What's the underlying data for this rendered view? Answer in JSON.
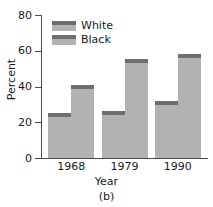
{
  "chart_data": {
    "type": "bar",
    "title": "",
    "subtitle": "",
    "caption": "(b)",
    "xlabel": "Year",
    "ylabel": "Percent",
    "categories": [
      "1968",
      "1979",
      "1990"
    ],
    "series": [
      {
        "name": "White",
        "values": [
          25,
          26.5,
          32
        ]
      },
      {
        "name": "Black",
        "values": [
          41,
          55.5,
          58
        ]
      }
    ],
    "ylim": [
      0,
      80
    ],
    "yticks": [
      0,
      20,
      40,
      60,
      80
    ],
    "ytick_labels": [
      "0",
      "20",
      "40",
      "60",
      "80"
    ],
    "grid": false,
    "legend_position": "upper-left-inside",
    "bar_fill_color": "#b2b2b2",
    "bar_cap_color": "#6e6e6e",
    "axis_color": "#4a4a4a",
    "text_color": "#1a1a1a",
    "background_color": "#ffffff"
  },
  "legend": {
    "items": [
      {
        "label": "White"
      },
      {
        "label": "Black"
      }
    ]
  },
  "axes": {
    "y_title": "Percent",
    "x_title": "Year",
    "y_tick_labels": [
      "80",
      "60",
      "40",
      "20",
      "0"
    ],
    "x_tick_labels": [
      "1968",
      "1979",
      "1990"
    ]
  },
  "caption": {
    "text": "(b)"
  }
}
